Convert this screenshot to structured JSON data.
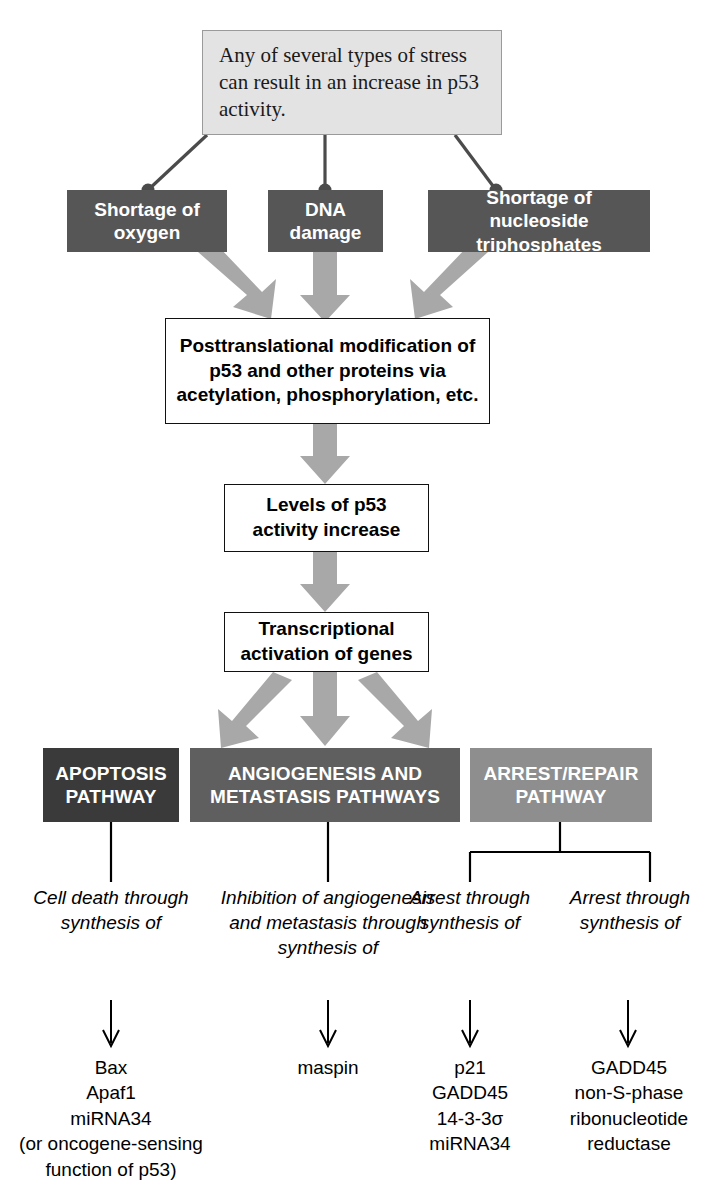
{
  "diagram": {
    "title_note": "p53 stress response pathway diagram",
    "callout": {
      "text": "Any of several types of stress can result in an increase in p53 activity."
    },
    "stress_boxes": [
      {
        "label": "Shortage of oxygen"
      },
      {
        "label": "DNA damage"
      },
      {
        "label": "Shortage of nucleoside triphosphates"
      }
    ],
    "process_boxes": [
      {
        "label": "Posttranslational modification of p53 and other proteins via acetylation, phosphorylation, etc."
      },
      {
        "label": "Levels of p53 activity increase"
      },
      {
        "label": "Transcriptional activation of genes"
      }
    ],
    "pathways": [
      {
        "label": "APOPTOSIS PATHWAY",
        "color": "#3a3a3a"
      },
      {
        "label": "ANGIOGENESIS AND METASTASIS PATHWAYS",
        "color": "#5f5f5f"
      },
      {
        "label": "ARREST/REPAIR PATHWAY",
        "color": "#8e8e8e"
      }
    ],
    "descriptors": [
      {
        "text": "Cell death through synthesis of"
      },
      {
        "text": "Inhibition of angiogenesis and metastasis through synthesis of"
      },
      {
        "text": "Arrest through synthesis of"
      },
      {
        "text": "Arrest through synthesis of"
      }
    ],
    "gene_lists": [
      {
        "items": "Bax\nApaf1\nmiRNA34\n(or oncogene-sensing\nfunction of p53)"
      },
      {
        "items": "maspin"
      },
      {
        "items": "p21\nGADD45\n14-3-3σ\nmiRNA34"
      },
      {
        "items": "GADD45\nnon-S-phase\nribonucleotide\nreductase"
      }
    ],
    "colors": {
      "callout_fill": "#e3e3e3",
      "stress_fill": "#565656",
      "arrow_gray": "#a8a8a8",
      "line_gray": "#4b4b4b"
    }
  }
}
